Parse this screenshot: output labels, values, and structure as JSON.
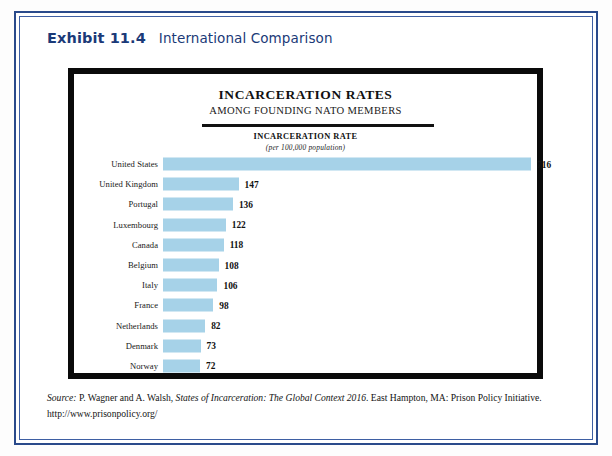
{
  "exhibit": {
    "number": "Exhibit 11.4",
    "title": "International Comparison"
  },
  "chart_data": {
    "type": "bar",
    "orientation": "horizontal",
    "title": "INCARCERATION RATES",
    "subtitle": "AMONG FOUNDING NATO MEMBERS",
    "xlabel": "INCARCERATION RATE",
    "xlabel_note": "(per 100,000 population)",
    "ylabel": "",
    "grid": false,
    "legend": "none",
    "xlim": [
      0,
      716
    ],
    "bar_color": "#a6d2e8",
    "categories": [
      "United States",
      "United Kingdom",
      "Portugal",
      "Luxembourg",
      "Canada",
      "Belgium",
      "Italy",
      "France",
      "Netherlands",
      "Denmark",
      "Norway"
    ],
    "values": [
      716,
      147,
      136,
      122,
      118,
      108,
      106,
      98,
      82,
      73,
      72
    ],
    "value_labels": [
      "716",
      "147",
      "136",
      "122",
      "118",
      "108",
      "106",
      "98",
      "82",
      "73",
      "72"
    ]
  },
  "source": {
    "prefix": "Source:",
    "authors": " P. Wagner and A. Walsh, ",
    "work": "States of Incarceration: The Global Context 2016",
    "publisher": ". East Hampton, MA: Prison Policy Initiative.",
    "url": "http://www.prisonpolicy.org/"
  },
  "colors": {
    "border_outer": "#2a4a8b",
    "border_inner": "#3e5fa3",
    "caption_text": "#1b3a78",
    "frame": "#0a0a0a",
    "bar": "#a6d2e8"
  }
}
